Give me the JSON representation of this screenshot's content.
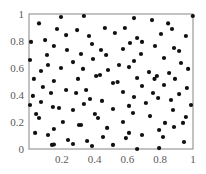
{
  "chart_data": {
    "type": "scatter",
    "title": "",
    "xlabel": "",
    "ylabel": "",
    "xlim": [
      0,
      1
    ],
    "ylim": [
      0,
      1
    ],
    "grid": false,
    "legend": null,
    "x_ticks": [
      "0.2",
      "0.4",
      "0.6",
      "0.8",
      "1"
    ],
    "y_ticks": [
      "0",
      "0.2",
      "0.4",
      "0.6",
      "0.8",
      "1"
    ],
    "marker_color": "#111111",
    "series": [
      {
        "name": "points",
        "points": [
          [
            0.061,
            0.93
          ],
          [
            0.195,
            0.978
          ],
          [
            0.335,
            0.985
          ],
          [
            0.64,
            0.97
          ],
          [
            0.75,
            0.955
          ],
          [
            0.848,
            0.93
          ],
          [
            0.171,
            0.889
          ],
          [
            0.226,
            0.844
          ],
          [
            0.293,
            0.881
          ],
          [
            0.463,
            0.896
          ],
          [
            0.585,
            0.896
          ],
          [
            0.366,
            0.837
          ],
          [
            0.524,
            0.859
          ],
          [
            0.805,
            0.852
          ],
          [
            0.872,
            0.889
          ],
          [
            0.659,
            0.822
          ],
          [
            0.616,
            0.785
          ],
          [
            0.957,
            0.837
          ],
          [
            0.012,
            0.793
          ],
          [
            0.098,
            0.807
          ],
          [
            0.152,
            0.763
          ],
          [
            0.317,
            0.704
          ],
          [
            0.384,
            0.778
          ],
          [
            0.573,
            0.741
          ],
          [
            0.689,
            0.793
          ],
          [
            0.768,
            0.763
          ],
          [
            0.884,
            0.748
          ],
          [
            0.915,
            0.726
          ],
          [
            0.11,
            0.696
          ],
          [
            0.232,
            0.733
          ],
          [
            0.439,
            0.733
          ],
          [
            0.683,
            0.704
          ],
          [
            0.823,
            0.674
          ],
          [
            0.006,
            0.659
          ],
          [
            0.268,
            0.644
          ],
          [
            0.39,
            0.667
          ],
          [
            0.47,
            0.696
          ],
          [
            0.549,
            0.622
          ],
          [
            0.64,
            0.652
          ],
          [
            0.927,
            0.637
          ],
          [
            0.116,
            0.622
          ],
          [
            0.073,
            0.578
          ],
          [
            0.195,
            0.6
          ],
          [
            0.329,
            0.593
          ],
          [
            0.482,
            0.585
          ],
          [
            0.61,
            0.607
          ],
          [
            0.732,
            0.57
          ],
          [
            0.854,
            0.563
          ],
          [
            0.97,
            0.593
          ],
          [
            0.03,
            0.519
          ],
          [
            0.152,
            0.504
          ],
          [
            0.299,
            0.519
          ],
          [
            0.409,
            0.541
          ],
          [
            0.433,
            0.548
          ],
          [
            0.54,
            0.496
          ],
          [
            0.659,
            0.526
          ],
          [
            0.78,
            0.541
          ],
          [
            0.512,
            0.489
          ],
          [
            0.765,
            0.519
          ],
          [
            0.89,
            0.519
          ],
          [
            0.085,
            0.459
          ],
          [
            0.134,
            0.415
          ],
          [
            0.226,
            0.437
          ],
          [
            0.287,
            0.415
          ],
          [
            0.348,
            0.437
          ],
          [
            0.573,
            0.422
          ],
          [
            0.689,
            0.467
          ],
          [
            0.823,
            0.474
          ],
          [
            0.963,
            0.452
          ],
          [
            0.024,
            0.393
          ],
          [
            0.372,
            0.37
          ],
          [
            0.445,
            0.356
          ],
          [
            0.64,
            0.385
          ],
          [
            0.756,
            0.415
          ],
          [
            0.915,
            0.407
          ],
          [
            0.787,
            0.378
          ],
          [
            0.006,
            0.326
          ],
          [
            0.073,
            0.348
          ],
          [
            0.183,
            0.304
          ],
          [
            0.268,
            0.289
          ],
          [
            0.335,
            0.333
          ],
          [
            0.512,
            0.296
          ],
          [
            0.61,
            0.319
          ],
          [
            0.713,
            0.341
          ],
          [
            0.866,
            0.363
          ],
          [
            0.988,
            0.326
          ],
          [
            0.043,
            0.259
          ],
          [
            0.061,
            0.23
          ],
          [
            0.207,
            0.2
          ],
          [
            0.305,
            0.178
          ],
          [
            0.402,
            0.259
          ],
          [
            0.421,
            0.23
          ],
          [
            0.573,
            0.2
          ],
          [
            0.634,
            0.267
          ],
          [
            0.738,
            0.244
          ],
          [
            0.878,
            0.289
          ],
          [
            0.957,
            0.237
          ],
          [
            0.939,
            0.193
          ],
          [
            0.037,
            0.119
          ],
          [
            0.116,
            0.104
          ],
          [
            0.152,
            0.148
          ],
          [
            0.238,
            0.067
          ],
          [
            0.268,
            0.037
          ],
          [
            0.354,
            0.059
          ],
          [
            0.317,
            0.178
          ],
          [
            0.476,
            0.156
          ],
          [
            0.61,
            0.119
          ],
          [
            0.689,
            0.104
          ],
          [
            0.793,
            0.141
          ],
          [
            0.829,
            0.193
          ],
          [
            0.884,
            0.163
          ],
          [
            0.14,
            0.03
          ],
          [
            0.384,
            0.022
          ],
          [
            0.451,
            0.089
          ],
          [
            0.512,
            0.03
          ],
          [
            0.591,
            0.081
          ],
          [
            0.659,
            0.0
          ],
          [
            0.793,
            0.007
          ],
          [
            0.817,
            0.089
          ],
          [
            0.945,
            0.052
          ],
          [
            0.146,
            0.311
          ],
          [
            0.152,
            0.033
          ],
          [
            0.999,
            0.985
          ]
        ]
      }
    ]
  }
}
